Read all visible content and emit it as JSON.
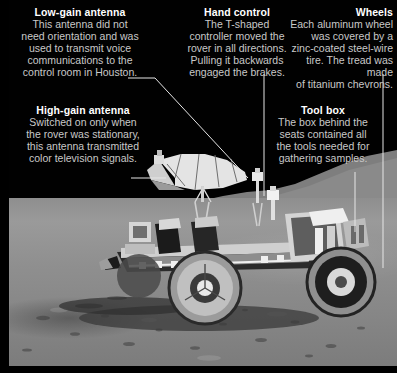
{
  "figure": {
    "background_color": "#000000",
    "photo": {
      "alt": "Apollo Lunar Roving Vehicle parked on the grey lunar surface beneath a black sky",
      "sky_color": "#010101",
      "ground_color": "#8e8e8e",
      "horizon_y": 204
    }
  },
  "annotations": [
    {
      "id": "low-gain-antenna",
      "heading": "Low-gain antenna",
      "body": "This antenna did not\nneed orientation and was\nused to transmit voice\ncommunications to the\ncontrol room in Houston.",
      "align": "center"
    },
    {
      "id": "hand-control",
      "heading": "Hand control",
      "body": "The T-shaped\ncontroller moved the\nrover in all directions.\nPulling it backwards\nengaged the brakes.",
      "align": "center"
    },
    {
      "id": "wheels",
      "heading": "Wheels",
      "body": "Each aluminum wheel\nwas covered by a\nzinc-coated steel-wire\ntire. The tread was made\nof titanium chevrons.",
      "align": "right"
    },
    {
      "id": "high-gain-antenna",
      "heading": "High-gain antenna",
      "body": "Switched on only when\nthe rover was stationary,\nthis antenna transmitted\ncolor television signals.",
      "align": "center"
    },
    {
      "id": "tool-box",
      "heading": "Tool box",
      "body": "The box behind the\nseats contained all\nthe tools needed for\ngathering samples.",
      "align": "center"
    }
  ],
  "leader_lines": [
    {
      "id": "leader-low-gain-antenna",
      "points": "128,78 155,78 248,178"
    },
    {
      "id": "leader-hand-control",
      "points": "264,74 264,196"
    },
    {
      "id": "leader-wheels",
      "points": "383,74 383,268"
    },
    {
      "id": "leader-high-gain-antenna",
      "points": "131,178 166,178"
    },
    {
      "id": "leader-tool-box",
      "points": "355,172 355,232"
    }
  ],
  "colors": {
    "heading_text": "#ffffff",
    "body_text": "#c9c9c9",
    "leader_line": "#e6e6e6",
    "page_background": "#000000"
  }
}
